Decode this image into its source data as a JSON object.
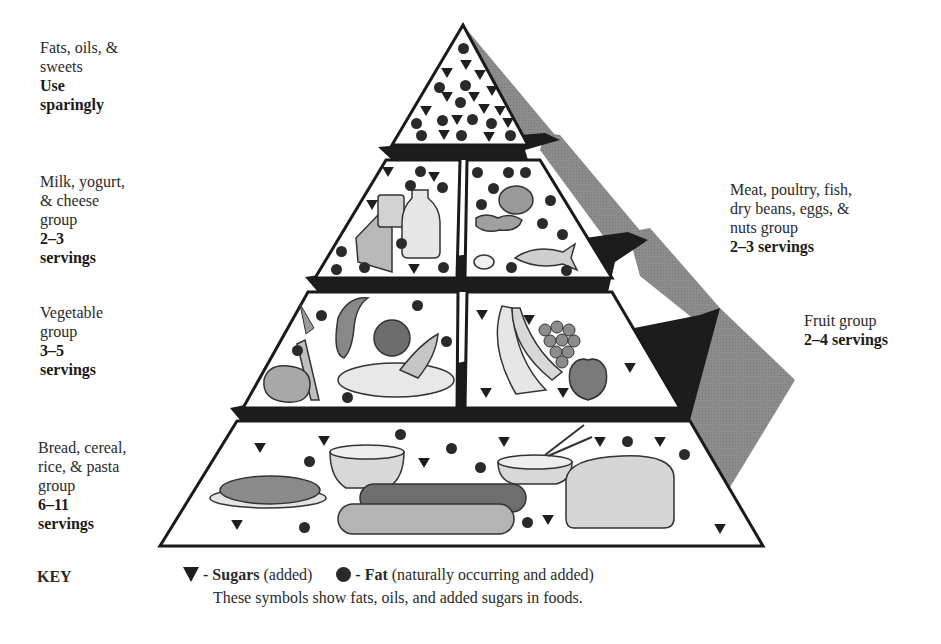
{
  "diagram": {
    "tiers": [
      {
        "id": "fats",
        "lines": [
          "Fats, oils, &",
          "sweets"
        ],
        "bold_lines": [
          "Use",
          "sparingly"
        ],
        "side": "left"
      },
      {
        "id": "milk",
        "lines": [
          "Milk, yogurt,",
          "& cheese",
          "group"
        ],
        "bold_lines": [
          "2–3",
          "servings"
        ],
        "side": "left"
      },
      {
        "id": "meat",
        "lines": [
          "Meat, poultry, fish,",
          "dry beans, eggs, &",
          "nuts group"
        ],
        "bold_lines": [
          "2–3 servings"
        ],
        "side": "right"
      },
      {
        "id": "vegetable",
        "lines": [
          "Vegetable",
          "group"
        ],
        "bold_lines": [
          "3–5",
          "servings"
        ],
        "side": "left"
      },
      {
        "id": "fruit",
        "lines": [
          "Fruit group"
        ],
        "bold_lines": [
          "2–4 servings"
        ],
        "side": "right"
      },
      {
        "id": "bread",
        "lines": [
          "Bread, cereal,",
          "rice, & pasta",
          "group"
        ],
        "bold_lines": [
          "6–11",
          "servings"
        ],
        "side": "left"
      }
    ],
    "key": {
      "title": "KEY",
      "sugars_symbol": "triangle-down",
      "sugars_label": "- Sugars",
      "sugars_note": "(added)",
      "fat_symbol": "circle",
      "fat_label": "- Fat",
      "fat_note": "(naturally occurring and added)",
      "explanation": "These symbols show fats, oils, and added sugars in foods."
    },
    "colors": {
      "outline": "#1a1a1a",
      "face": "#ffffff",
      "side_shade": "#8a8a8a",
      "ledge": "#1c1c1c",
      "symbol": "#1e1e1e"
    },
    "food_illustrations": {
      "milk": [
        "cheese wedge",
        "yogurt cup",
        "milk jug"
      ],
      "meat": [
        "chicken leg",
        "dry beans",
        "eggs",
        "fish"
      ],
      "vegetable": [
        "carrot",
        "squash",
        "tomato",
        "potato",
        "peas",
        "plate"
      ],
      "fruit": [
        "bananas",
        "grapes",
        "apple"
      ],
      "bread": [
        "spaghetti",
        "cereal bowl",
        "rice bowl with chopsticks",
        "bread rolls",
        "loaf of bread"
      ]
    }
  }
}
